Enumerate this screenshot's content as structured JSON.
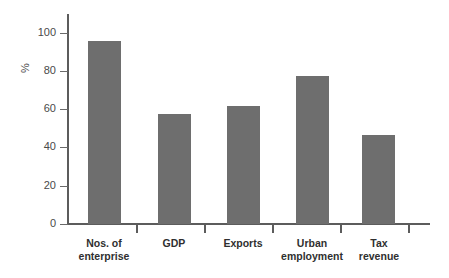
{
  "chart_data": {
    "type": "bar",
    "title": "",
    "subtitle": "",
    "xlabel": "",
    "ylabel": "%",
    "categories": [
      "Nos. of enterprise",
      "GDP",
      "Exports",
      "Urban employment",
      "Tax revenue"
    ],
    "category_lines": [
      [
        "Nos. of",
        "enterprise"
      ],
      [
        "GDP",
        ""
      ],
      [
        "Exports",
        ""
      ],
      [
        "Urban",
        "employment"
      ],
      [
        "Tax",
        "revenue"
      ]
    ],
    "values": [
      96,
      57.5,
      62,
      77.5,
      46.5
    ],
    "ylim": [
      0,
      100
    ],
    "yticks": [
      0,
      20,
      40,
      60,
      80,
      100
    ],
    "ytick_labels": [
      "0",
      "20",
      "40",
      "60",
      "80",
      "100"
    ],
    "grid": false,
    "legend": false,
    "legend_position": "none",
    "bar_color": "#6e6e6e",
    "axis_color": "#5c5c5c",
    "background_color": "#ffffff"
  }
}
